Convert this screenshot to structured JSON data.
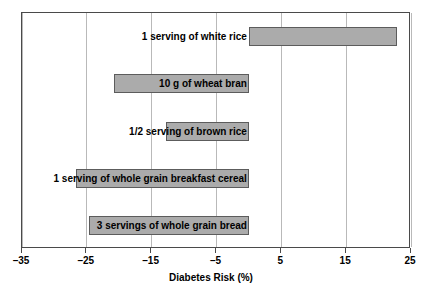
{
  "chart_data": {
    "type": "bar",
    "orientation": "horizontal",
    "title": "",
    "xlabel": "Diabetes Risk (%)",
    "ylabel": "",
    "xlim": [
      -35,
      25
    ],
    "xticks": [
      -35,
      -25,
      -15,
      -5,
      5,
      15,
      25
    ],
    "xticklabels": [
      "–35",
      "–25",
      "–15",
      "–5",
      "5",
      "15",
      "25"
    ],
    "grid": true,
    "grid_axis": "x",
    "legend": false,
    "categories": [
      "1 serving of white rice",
      "10 g of wheat bran",
      "1/2 serving of brown rice",
      "1 serving of whole grain breakfast cereal",
      "3 servings of whole grain bread"
    ],
    "values": [
      22.8,
      -20.8,
      -12.8,
      -26.6,
      -24.6
    ],
    "bar_color": "#ababab",
    "bar_edge_color": "#5c5c5c",
    "axis_color": "#4a4a4a",
    "grid_color": "#b9b9b9",
    "background_color": "#ffffff"
  }
}
